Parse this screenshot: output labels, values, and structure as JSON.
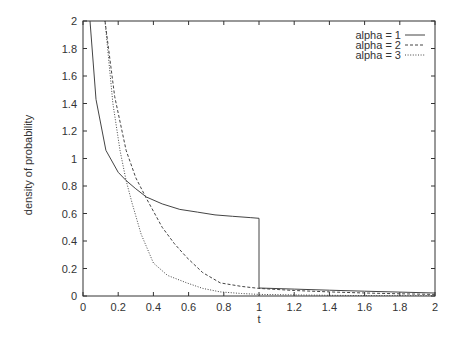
{
  "chart_data": {
    "type": "line",
    "title": "",
    "xlabel": "t",
    "ylabel": "density of probability",
    "xlim": [
      0,
      2
    ],
    "ylim": [
      0,
      2
    ],
    "x_ticks": [
      "0",
      "0.2",
      "0.4",
      "0.6",
      "0.8",
      "1",
      "1.2",
      "1.4",
      "1.6",
      "1.8",
      "2"
    ],
    "y_ticks": [
      "0",
      "0.2",
      "0.4",
      "0.6",
      "0.8",
      "1",
      "1.2",
      "1.4",
      "1.6",
      "1.8",
      "2"
    ],
    "grid": false,
    "legend_position": "top-right",
    "series": [
      {
        "name": "alpha = 1",
        "style": "solid",
        "x": [
          0.04,
          0.074,
          0.13,
          0.2,
          0.245,
          0.3,
          0.36,
          0.45,
          0.55,
          0.65,
          0.75,
          0.85,
          0.95,
          1.0,
          1.0,
          1.2,
          1.4,
          1.6,
          1.8,
          2.0
        ],
        "y": [
          2.0,
          1.43,
          1.06,
          0.9,
          0.84,
          0.78,
          0.72,
          0.67,
          0.63,
          0.61,
          0.59,
          0.58,
          0.57,
          0.565,
          0.058,
          0.05,
          0.042,
          0.035,
          0.028,
          0.022
        ]
      },
      {
        "name": "alpha = 2",
        "style": "dashed",
        "x": [
          0.125,
          0.18,
          0.245,
          0.3,
          0.36,
          0.45,
          0.52,
          0.59,
          0.68,
          0.78,
          0.9,
          1.0,
          1.2,
          1.4,
          1.6,
          1.8,
          2.0
        ],
        "y": [
          2.0,
          1.45,
          1.06,
          0.86,
          0.71,
          0.5,
          0.38,
          0.28,
          0.17,
          0.095,
          0.07,
          0.055,
          0.04,
          0.03,
          0.022,
          0.016,
          0.012
        ]
      },
      {
        "name": "alpha = 3",
        "style": "dotted",
        "x": [
          0.125,
          0.17,
          0.21,
          0.245,
          0.28,
          0.33,
          0.4,
          0.48,
          0.59,
          0.68,
          0.78,
          0.9,
          1.0,
          1.2,
          1.4,
          1.6,
          1.8,
          2.0
        ],
        "y": [
          2.0,
          1.4,
          1.06,
          0.84,
          0.67,
          0.45,
          0.24,
          0.15,
          0.095,
          0.055,
          0.03,
          0.018,
          0.012,
          0.008,
          0.005,
          0.003,
          0.002,
          0.001
        ]
      }
    ]
  }
}
